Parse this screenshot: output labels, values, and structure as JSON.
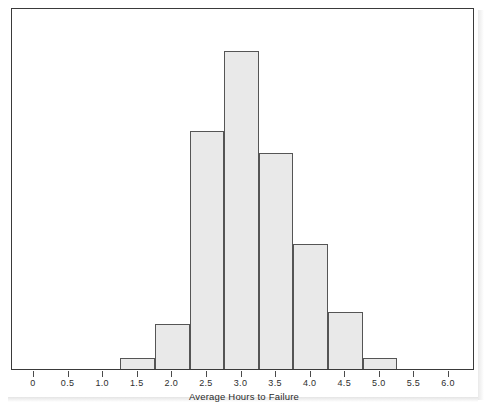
{
  "figure": {
    "background_color": "#ffffff",
    "frame_color": "#3a3a3a",
    "bar_fill_color": "#e9e9e9",
    "bar_edge_color": "#555555",
    "text_color": "#2b2b2b"
  },
  "chart_data": {
    "type": "bar",
    "subtype": "histogram",
    "title": "",
    "subtitle": "",
    "xlabel": "Average Hours to Failure",
    "ylabel": "",
    "xlim": [
      -0.45,
      6.35
    ],
    "ylim": [
      0,
      28
    ],
    "grid": false,
    "legend": null,
    "xticks": [
      0,
      0.5,
      1.0,
      1.5,
      2.0,
      2.5,
      3.0,
      3.5,
      4.0,
      4.5,
      5.0,
      5.5,
      6.0
    ],
    "xtick_labels": [
      "0",
      "0.5",
      "1.0",
      "1.5",
      "2.0",
      "2.5",
      "3.0",
      "3.5",
      "4.0",
      "4.5",
      "5.0",
      "5.5",
      "6.0"
    ],
    "yticks": [],
    "ytick_labels": [],
    "bin_width": 0.5,
    "bin_edges": [
      1.25,
      1.75,
      2.25,
      2.75,
      3.25,
      3.75,
      4.25,
      4.75,
      5.25
    ],
    "bin_centers": [
      1.5,
      2.0,
      2.5,
      3.0,
      3.5,
      4.0,
      4.5,
      5.0
    ],
    "values": [
      1,
      4,
      21,
      28,
      19,
      11,
      5,
      1
    ],
    "bars": [
      {
        "left": 1.25,
        "right": 1.75,
        "center": 1.5,
        "count": 1
      },
      {
        "left": 1.75,
        "right": 2.25,
        "center": 2.0,
        "count": 4
      },
      {
        "left": 2.25,
        "right": 2.75,
        "center": 2.5,
        "count": 21
      },
      {
        "left": 2.75,
        "right": 3.25,
        "center": 3.0,
        "count": 28
      },
      {
        "left": 3.25,
        "right": 3.75,
        "center": 3.5,
        "count": 19
      },
      {
        "left": 3.75,
        "right": 4.25,
        "center": 4.0,
        "count": 11
      },
      {
        "left": 4.25,
        "right": 4.75,
        "center": 4.5,
        "count": 5
      },
      {
        "left": 4.75,
        "right": 5.25,
        "center": 5.0,
        "count": 1
      }
    ]
  }
}
